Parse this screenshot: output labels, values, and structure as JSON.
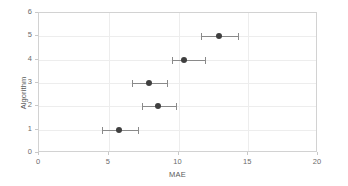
{
  "chart_data": {
    "type": "scatter",
    "title": "",
    "xlabel": "MAE",
    "ylabel": "Algorithm",
    "xlim": [
      0,
      20
    ],
    "ylim": [
      0,
      6
    ],
    "xticks": [
      0,
      5,
      10,
      15,
      20
    ],
    "yticks": [
      0,
      1,
      2,
      3,
      4,
      5,
      6
    ],
    "grid": true,
    "legend": null,
    "orientation": "horizontal",
    "marker": "circle",
    "marker_color": "#3f3f3f",
    "errorbar_color": "#8a8a8a",
    "gridline_color": "#ededed",
    "border_color": "#d2d2d2",
    "categories": [
      "1",
      "2",
      "3",
      "4",
      "5"
    ],
    "points": [
      {
        "algorithm": 1,
        "mae": 5.7,
        "ci_low": 4.5,
        "ci_high": 7.1
      },
      {
        "algorithm": 2,
        "mae": 8.5,
        "ci_low": 7.4,
        "ci_high": 9.8
      },
      {
        "algorithm": 3,
        "mae": 7.9,
        "ci_low": 6.7,
        "ci_high": 9.2
      },
      {
        "algorithm": 4,
        "mae": 10.4,
        "ci_low": 9.5,
        "ci_high": 11.9
      },
      {
        "algorithm": 5,
        "mae": 12.9,
        "ci_low": 11.6,
        "ci_high": 14.3
      }
    ],
    "values": [
      5.7,
      8.5,
      7.9,
      10.4,
      12.9
    ],
    "errors_low": [
      4.5,
      7.4,
      6.7,
      9.5,
      11.6
    ],
    "errors_high": [
      7.1,
      9.8,
      9.2,
      11.9,
      14.3
    ]
  }
}
